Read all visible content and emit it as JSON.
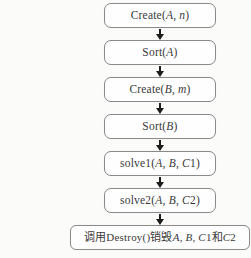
{
  "flowchart": {
    "colors": {
      "background": "#fbfbf9",
      "box_fill": "#fefefe",
      "box_border": "#8a8a8a",
      "text": "#3a3a3a",
      "arrow": "#1c1c1c"
    },
    "nodes": [
      {
        "id": "create-a",
        "wide": false,
        "text": "Create(A, n)",
        "segments": [
          {
            "t": "Create(",
            "i": false
          },
          {
            "t": "A",
            "i": true
          },
          {
            "t": ", ",
            "i": false
          },
          {
            "t": "n",
            "i": true
          },
          {
            "t": ")",
            "i": false
          }
        ]
      },
      {
        "id": "sort-a",
        "wide": false,
        "text": "Sort(A)",
        "segments": [
          {
            "t": "Sort(",
            "i": false
          },
          {
            "t": "A",
            "i": true
          },
          {
            "t": ")",
            "i": false
          }
        ]
      },
      {
        "id": "create-b",
        "wide": false,
        "text": "Create(B, m)",
        "segments": [
          {
            "t": "Create(",
            "i": false
          },
          {
            "t": "B",
            "i": true
          },
          {
            "t": ", ",
            "i": false
          },
          {
            "t": "m",
            "i": true
          },
          {
            "t": ")",
            "i": false
          }
        ]
      },
      {
        "id": "sort-b",
        "wide": false,
        "text": "Sort(B)",
        "segments": [
          {
            "t": "Sort(",
            "i": false
          },
          {
            "t": "B",
            "i": true
          },
          {
            "t": ")",
            "i": false
          }
        ]
      },
      {
        "id": "solve1",
        "wide": false,
        "text": "solve1(A, B, C1)",
        "segments": [
          {
            "t": "solve1(",
            "i": false
          },
          {
            "t": "A",
            "i": true
          },
          {
            "t": ", ",
            "i": false
          },
          {
            "t": "B",
            "i": true
          },
          {
            "t": ", ",
            "i": false
          },
          {
            "t": "C",
            "i": true
          },
          {
            "t": "1)",
            "i": false
          }
        ]
      },
      {
        "id": "solve2",
        "wide": false,
        "text": "solve2(A, B, C2)",
        "segments": [
          {
            "t": "solve2(",
            "i": false
          },
          {
            "t": "A",
            "i": true
          },
          {
            "t": ", ",
            "i": false
          },
          {
            "t": "B",
            "i": true
          },
          {
            "t": ", ",
            "i": false
          },
          {
            "t": "C",
            "i": true
          },
          {
            "t": "2)",
            "i": false
          }
        ]
      },
      {
        "id": "destroy-all",
        "wide": true,
        "text": "调用Destroy()销毁A, B, C1和C2",
        "segments": [
          {
            "t": "调用Destroy()销毁",
            "i": false
          },
          {
            "t": "A",
            "i": true
          },
          {
            "t": ", ",
            "i": false
          },
          {
            "t": "B",
            "i": true
          },
          {
            "t": ", ",
            "i": false
          },
          {
            "t": "C",
            "i": true
          },
          {
            "t": "1和",
            "i": false
          },
          {
            "t": "C",
            "i": true
          },
          {
            "t": "2",
            "i": false
          }
        ]
      }
    ]
  }
}
